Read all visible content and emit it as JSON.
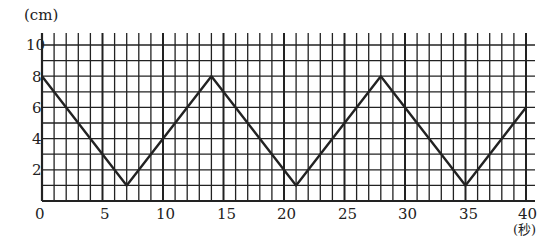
{
  "chart_data": {
    "type": "line",
    "title": "",
    "xlabel": "(秒)",
    "ylabel": "(cm)",
    "x": [
      0,
      7,
      14,
      21,
      28,
      35,
      40
    ],
    "series": [
      {
        "name": "position",
        "values": [
          8,
          1,
          8,
          1,
          8,
          1,
          6
        ]
      }
    ],
    "xlim": [
      0,
      40
    ],
    "ylim": [
      0,
      10
    ],
    "x_ticks": [
      0,
      5,
      10,
      15,
      20,
      25,
      30,
      35,
      40
    ],
    "y_ticks": [
      2,
      4,
      6,
      8,
      10
    ],
    "grid": true,
    "grid_minor_x": 1,
    "grid_minor_y": 1,
    "legend": "none"
  },
  "labels": {
    "y_unit": "(cm)",
    "x_unit": "(秒)",
    "y_tick_labels": [
      "10",
      "8",
      "6",
      "4",
      "2"
    ],
    "x_tick_labels": [
      "0",
      "5",
      "10",
      "15",
      "20",
      "25",
      "30",
      "35",
      "40"
    ]
  }
}
